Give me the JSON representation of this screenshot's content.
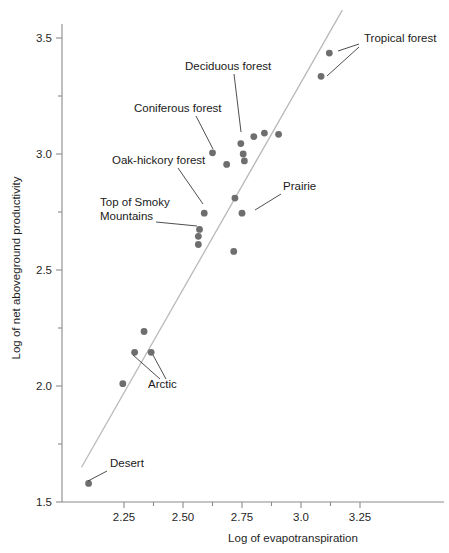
{
  "chart_data": {
    "type": "scatter",
    "title": "",
    "xlabel": "Log of evapotranspiration",
    "ylabel": "Log of net aboveground productivity",
    "xlim": [
      2.05,
      3.42
    ],
    "ylim": [
      1.5,
      3.62
    ],
    "grid": false,
    "legend": "none",
    "x_ticks": [
      {
        "value": 2.25,
        "label": "2.25",
        "major": true
      },
      {
        "value": 2.375,
        "label": "",
        "major": false
      },
      {
        "value": 2.5,
        "label": "2.50",
        "major": true
      },
      {
        "value": 2.625,
        "label": "",
        "major": false
      },
      {
        "value": 2.75,
        "label": "2.75",
        "major": true
      },
      {
        "value": 2.875,
        "label": "",
        "major": false
      },
      {
        "value": 3.0,
        "label": "3.0",
        "major": true
      },
      {
        "value": 3.125,
        "label": "",
        "major": false
      },
      {
        "value": 3.25,
        "label": "3.25",
        "major": true
      }
    ],
    "y_ticks": [
      {
        "value": 3.5,
        "label": "3.5",
        "major": true
      },
      {
        "value": 3.25,
        "label": "",
        "major": false
      },
      {
        "value": 3.0,
        "label": "3.0",
        "major": true
      },
      {
        "value": 2.75,
        "label": "",
        "major": false
      },
      {
        "value": 2.5,
        "label": "2.5",
        "major": true
      },
      {
        "value": 2.25,
        "label": "",
        "major": false
      },
      {
        "value": 2.0,
        "label": "2.0",
        "major": true
      },
      {
        "value": 1.75,
        "label": "",
        "major": false
      },
      {
        "value": 1.5,
        "label": "1.5",
        "major": true
      }
    ],
    "point_color": "#6e6e6e",
    "fit_line_color": "#b9b9b9",
    "fit_line": {
      "x1": 2.07,
      "y1": 1.65,
      "x2": 3.175,
      "y2": 3.62
    },
    "points": [
      {
        "x": 2.1,
        "y": 1.58,
        "label": "Desert"
      },
      {
        "x": 2.245,
        "y": 2.01,
        "label": ""
      },
      {
        "x": 2.295,
        "y": 2.145,
        "label": "Arctic"
      },
      {
        "x": 2.335,
        "y": 2.235,
        "label": ""
      },
      {
        "x": 2.365,
        "y": 2.145,
        "label": "Arctic"
      },
      {
        "x": 2.565,
        "y": 2.61,
        "label": ""
      },
      {
        "x": 2.565,
        "y": 2.645,
        "label": "Top of Smoky Mountains"
      },
      {
        "x": 2.57,
        "y": 2.675,
        "label": "Top of Smoky Mountains"
      },
      {
        "x": 2.59,
        "y": 2.745,
        "label": "Oak-hickory forest"
      },
      {
        "x": 2.625,
        "y": 3.005,
        "label": "Coniferous forest"
      },
      {
        "x": 2.685,
        "y": 2.955,
        "label": ""
      },
      {
        "x": 2.715,
        "y": 2.58,
        "label": ""
      },
      {
        "x": 2.72,
        "y": 2.81,
        "label": ""
      },
      {
        "x": 2.745,
        "y": 3.045,
        "label": "Deciduous forest"
      },
      {
        "x": 2.75,
        "y": 2.745,
        "label": "Prairie"
      },
      {
        "x": 2.755,
        "y": 3.0,
        "label": ""
      },
      {
        "x": 2.76,
        "y": 2.97,
        "label": ""
      },
      {
        "x": 2.8,
        "y": 3.075,
        "label": ""
      },
      {
        "x": 2.845,
        "y": 3.09,
        "label": ""
      },
      {
        "x": 2.905,
        "y": 3.085,
        "label": ""
      },
      {
        "x": 3.085,
        "y": 3.335,
        "label": "Tropical forest"
      },
      {
        "x": 3.12,
        "y": 3.435,
        "label": "Tropical forest"
      }
    ],
    "annotations": [
      {
        "name": "tropical-forest",
        "text": "Tropical forest",
        "text_x": 364,
        "text_y": 42,
        "leaders": [
          {
            "x1": 359,
            "y1": 44,
            "x2": 338,
            "y2": 51
          },
          {
            "x1": 359,
            "y1": 47,
            "x2": 327,
            "y2": 76
          }
        ]
      },
      {
        "name": "deciduous-forest",
        "text": "Deciduous forest",
        "text_x": 185,
        "text_y": 70,
        "leaders": [
          {
            "x1": 234,
            "y1": 74,
            "x2": 241,
            "y2": 132
          }
        ]
      },
      {
        "name": "coniferous-forest",
        "text": "Coniferous forest",
        "text_x": 134,
        "text_y": 112,
        "leaders": [
          {
            "x1": 196,
            "y1": 116,
            "x2": 213,
            "y2": 149
          }
        ]
      },
      {
        "name": "oak-hickory-forest",
        "text": "Oak-hickory forest",
        "text_x": 112,
        "text_y": 164,
        "leaders": [
          {
            "x1": 178,
            "y1": 168,
            "x2": 203,
            "y2": 204
          }
        ]
      },
      {
        "name": "top-of-smoky-mountains",
        "text_line1": "Top of Smoky",
        "text_line2": "Mountains",
        "text_x": 100,
        "text_y": 206,
        "leaders": [
          {
            "x1": 156,
            "y1": 222,
            "x2": 197,
            "y2": 226
          }
        ]
      },
      {
        "name": "prairie",
        "text": "Prairie",
        "text_x": 283,
        "text_y": 190,
        "leaders": [
          {
            "x1": 281,
            "y1": 194,
            "x2": 255,
            "y2": 210
          }
        ]
      },
      {
        "name": "arctic",
        "text": "Arctic",
        "text_x": 148,
        "text_y": 388,
        "leaders": [
          {
            "x1": 160,
            "y1": 379,
            "x2": 133,
            "y2": 355
          },
          {
            "x1": 166,
            "y1": 379,
            "x2": 153,
            "y2": 355
          }
        ]
      },
      {
        "name": "desert",
        "text": "Desert",
        "text_x": 110,
        "text_y": 467,
        "leaders": [
          {
            "x1": 107,
            "y1": 471,
            "x2": 88,
            "y2": 481
          }
        ]
      }
    ]
  }
}
